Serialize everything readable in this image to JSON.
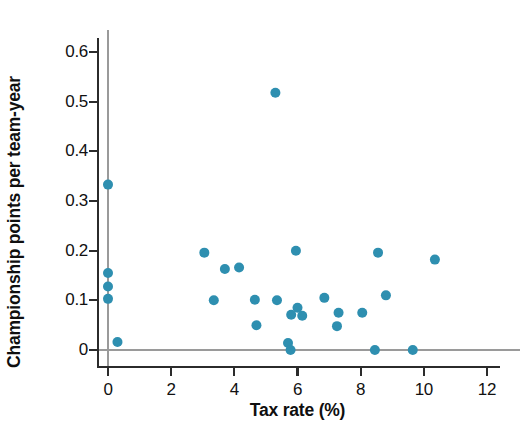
{
  "chart_data": {
    "type": "scatter",
    "title": "",
    "xlabel": "Tax rate (%)",
    "ylabel": "Championship points per team-year",
    "xlim": [
      -0.55,
      12.35
    ],
    "ylim": [
      -0.03,
      0.635
    ],
    "xticks": [
      0,
      2,
      4,
      6,
      8,
      10,
      12
    ],
    "xticklabels": [
      "0",
      "2",
      "4",
      "6",
      "8",
      "10",
      "12"
    ],
    "yticks": [
      0,
      0.1,
      0.2,
      0.3,
      0.4,
      0.5,
      0.6
    ],
    "yticklabels": [
      "0",
      "0.1",
      "0.2",
      "0.3",
      "0.4",
      "0.5",
      "0.6"
    ],
    "grid": false,
    "legend": null,
    "reference_lines": [
      {
        "orientation": "horizontal",
        "value": 0,
        "color": "#9a9a9a"
      },
      {
        "orientation": "vertical",
        "value": 0,
        "color": "#9a9a9a"
      }
    ],
    "marker": {
      "shape": "circle",
      "color": "#2e8fb0",
      "size_px": 10,
      "edge": "none"
    },
    "series": [
      {
        "name": "Teams",
        "color": "#2e8fb0",
        "points": [
          {
            "x": 0.0,
            "y": 0.333
          },
          {
            "x": 0.0,
            "y": 0.155
          },
          {
            "x": 0.0,
            "y": 0.128
          },
          {
            "x": 0.0,
            "y": 0.103
          },
          {
            "x": 0.3,
            "y": 0.016
          },
          {
            "x": 3.05,
            "y": 0.196
          },
          {
            "x": 3.35,
            "y": 0.1
          },
          {
            "x": 3.7,
            "y": 0.163
          },
          {
            "x": 4.15,
            "y": 0.166
          },
          {
            "x": 4.65,
            "y": 0.101
          },
          {
            "x": 4.7,
            "y": 0.05
          },
          {
            "x": 5.3,
            "y": 0.518
          },
          {
            "x": 5.35,
            "y": 0.1
          },
          {
            "x": 5.7,
            "y": 0.014
          },
          {
            "x": 5.78,
            "y": 0.0
          },
          {
            "x": 5.8,
            "y": 0.071
          },
          {
            "x": 5.95,
            "y": 0.2
          },
          {
            "x": 6.0,
            "y": 0.085
          },
          {
            "x": 6.15,
            "y": 0.069
          },
          {
            "x": 6.85,
            "y": 0.105
          },
          {
            "x": 7.25,
            "y": 0.048
          },
          {
            "x": 7.3,
            "y": 0.075
          },
          {
            "x": 8.05,
            "y": 0.075
          },
          {
            "x": 8.45,
            "y": 0.0
          },
          {
            "x": 8.55,
            "y": 0.196
          },
          {
            "x": 8.8,
            "y": 0.11
          },
          {
            "x": 9.65,
            "y": 0.0
          },
          {
            "x": 10.35,
            "y": 0.182
          }
        ]
      }
    ]
  },
  "axes": {
    "x_title": "Tax rate (%)",
    "y_title": "Championship points per team-year"
  },
  "colors": {
    "marker": "#2e8fb0",
    "axis": "#2b2b2b",
    "reference_line": "#9a9a9a",
    "text": "#111111",
    "background": "#ffffff"
  }
}
